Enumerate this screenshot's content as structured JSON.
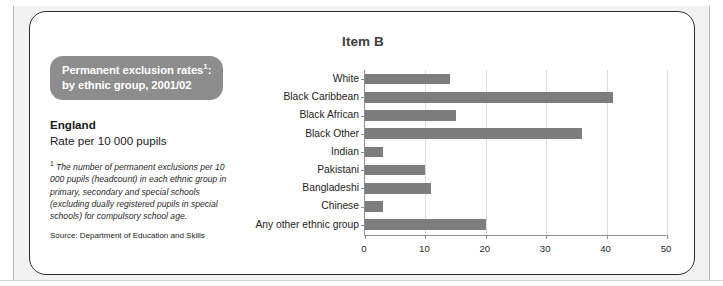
{
  "card": {
    "chart_title": "Item B"
  },
  "caption": {
    "pill_line1": "Permanent exclusion rates",
    "pill_footnote_marker": "1",
    "pill_line1_suffix": ":",
    "pill_line2": "by ethnic group, 2001/02",
    "country": "England",
    "rate_label": "Rate per 10 000 pupils",
    "footnote_marker": "1",
    "footnote_text": "The number of permanent exclusions per 10 000 pupils (headcount) in each ethnic group in primary, secondary and special schools (excluding dually registered pupils in special schools) for compulsory school age.",
    "source": "Source: Department of Education and Skills"
  },
  "chart_data": {
    "type": "bar",
    "orientation": "horizontal",
    "title": "Item B",
    "subtitle": "Permanent exclusion rates1: by ethnic group, 2001/02",
    "xlabel": "",
    "ylabel": "",
    "xlim": [
      0,
      50
    ],
    "xticks": [
      0,
      10,
      20,
      30,
      40,
      50
    ],
    "xtick_labels": [
      "0",
      "10",
      "20",
      "30",
      "40",
      "50"
    ],
    "grid": true,
    "legend": "none",
    "unit": "Rate per 10 000 pupils",
    "bar_color": "#7d7d7d",
    "categories": [
      "White",
      "Black Caribbean",
      "Black African",
      "Black Other",
      "Indian",
      "Pakistani",
      "Bangladeshi",
      "Chinese",
      "Any other ethnic group"
    ],
    "values": [
      14,
      41,
      15,
      36,
      3,
      10,
      11,
      3,
      20
    ]
  }
}
